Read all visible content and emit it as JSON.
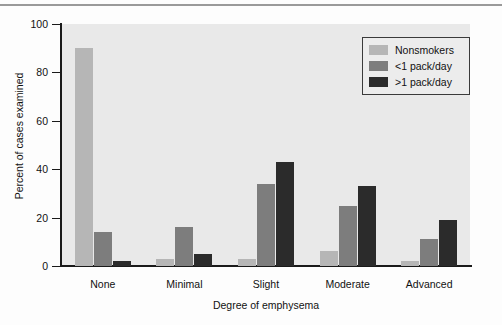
{
  "chart_data": {
    "type": "bar",
    "title": "",
    "xlabel": "Degree of emphysema",
    "ylabel": "Percent of cases examined",
    "categories": [
      "None",
      "Minimal",
      "Slight",
      "Moderate",
      "Advanced"
    ],
    "series": [
      {
        "name": "Nonsmokers",
        "color": "#b6b6b6",
        "values": [
          90,
          3,
          3,
          6,
          2
        ]
      },
      {
        "name": "<1 pack/day",
        "color": "#7d7d7d",
        "values": [
          14,
          16,
          34,
          25,
          11
        ]
      },
      {
        "name": ">1 pack/day",
        "color": "#2b2b2b",
        "values": [
          2,
          5,
          43,
          33,
          19
        ]
      }
    ],
    "ylim": [
      0,
      100
    ],
    "yticks": [
      0,
      20,
      40,
      60,
      80,
      100
    ],
    "ytick_labels": [
      "0",
      "20",
      "40",
      "60",
      "80",
      "100"
    ],
    "grid": false,
    "legend_position": "top-right",
    "plot_background": "#e9e9e9",
    "axis_color": "#1a1a1a"
  },
  "legend": {
    "entries": [
      {
        "label": "Nonsmokers"
      },
      {
        "label": "<1 pack/day"
      },
      {
        "label": ">1 pack/day"
      }
    ]
  }
}
